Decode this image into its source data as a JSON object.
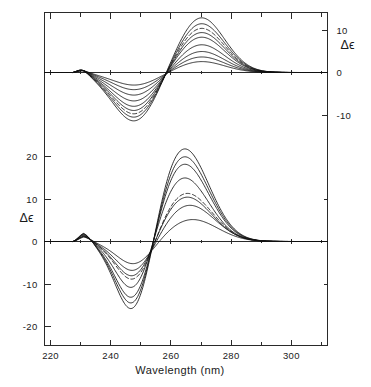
{
  "figure": {
    "background_color": "#ffffff",
    "line_color": "#111111"
  },
  "axes": {
    "x_title": "Wavelength  (nm)",
    "x_tick_labels": [
      "220",
      "240",
      "260",
      "280",
      "300"
    ],
    "x_major_ticks": [
      220,
      240,
      260,
      280,
      300
    ],
    "x_minor_ticks": [
      230,
      250,
      270,
      290,
      310
    ],
    "x_range": [
      218,
      312
    ],
    "left_axis_title": "Δϵ",
    "left_tick_labels": [
      "20",
      "10",
      "0",
      "-10",
      "-20"
    ],
    "left_tick_values": [
      20,
      10,
      0,
      -10,
      -20
    ],
    "right_axis_title": "Δϵ",
    "right_tick_labels": [
      "10",
      "0",
      "-10"
    ],
    "right_tick_values": [
      10,
      0,
      -10
    ]
  },
  "chart_data": {
    "type": "line",
    "title": "",
    "xlabel": "Wavelength  (nm)",
    "ylabel": "Δϵ",
    "xlim": [
      218,
      312
    ],
    "grid": false,
    "legend": "none",
    "panels": [
      {
        "name": "upper-panel",
        "ylim": [
          -16,
          16
        ],
        "y_ticks": [
          10,
          0,
          -10
        ],
        "y_axis_side": "right",
        "description": "Family of CD spectra with negative band near 248 nm and positive band near 270 nm",
        "crossover_nm": [
          233,
          259.5,
          292
        ],
        "series": [
          {
            "name": "curve-1",
            "style": "solid",
            "trough_nm": 248,
            "trough_value": -11.6,
            "peak_nm": 270,
            "peak_value": 13.0
          },
          {
            "name": "curve-2",
            "style": "solid",
            "trough_nm": 248,
            "trough_value": -10.7,
            "peak_nm": 270,
            "peak_value": 11.6
          },
          {
            "name": "curve-3",
            "style": "dashed",
            "trough_nm": 248,
            "trough_value": -9.9,
            "peak_nm": 270,
            "peak_value": 10.5
          },
          {
            "name": "curve-4",
            "style": "solid",
            "trough_nm": 248,
            "trough_value": -9.1,
            "peak_nm": 270,
            "peak_value": 9.5
          },
          {
            "name": "curve-5",
            "style": "solid",
            "trough_nm": 248,
            "trough_value": -8.1,
            "peak_nm": 270,
            "peak_value": 8.4
          },
          {
            "name": "curve-6",
            "style": "solid",
            "trough_nm": 248,
            "trough_value": -6.8,
            "peak_nm": 270,
            "peak_value": 6.6
          },
          {
            "name": "curve-7",
            "style": "solid",
            "trough_nm": 248,
            "trough_value": -5.4,
            "peak_nm": 270,
            "peak_value": 5.0
          },
          {
            "name": "curve-8",
            "style": "solid",
            "trough_nm": 248,
            "trough_value": -4.1,
            "peak_nm": 270,
            "peak_value": 3.7
          },
          {
            "name": "curve-9",
            "style": "solid",
            "trough_nm": 248,
            "trough_value": -3.0,
            "peak_nm": 270,
            "peak_value": 2.6
          }
        ]
      },
      {
        "name": "lower-panel",
        "ylim": [
          -24,
          26
        ],
        "y_ticks": [
          20,
          10,
          0,
          -10,
          -20
        ],
        "y_axis_side": "left",
        "description": "Family of CD spectra with deep negative band near 248 nm and strong positive band near 264 nm",
        "crossover_nm": [
          234.5,
          254.5,
          291
        ],
        "series": [
          {
            "name": "curve-1",
            "style": "solid",
            "trough_nm": 248,
            "trough_value": -19.0,
            "peak_nm": 264,
            "peak_value": 22.3
          },
          {
            "name": "curve-2",
            "style": "solid",
            "trough_nm": 248,
            "trough_value": -17.4,
            "peak_nm": 264,
            "peak_value": 20.4
          },
          {
            "name": "curve-3",
            "style": "solid",
            "trough_nm": 248,
            "trough_value": -15.8,
            "peak_nm": 264,
            "peak_value": 18.6
          },
          {
            "name": "curve-4",
            "style": "solid",
            "trough_nm": 248,
            "trough_value": -13.0,
            "peak_nm": 264,
            "peak_value": 15.3
          },
          {
            "name": "curve-5",
            "style": "dashed",
            "trough_nm": 248,
            "trough_value": -10.2,
            "peak_nm": 265,
            "peak_value": 11.5
          },
          {
            "name": "curve-6",
            "style": "solid",
            "trough_nm": 248,
            "trough_value": -9.3,
            "peak_nm": 265,
            "peak_value": 10.6
          },
          {
            "name": "curve-7",
            "style": "solid",
            "trough_nm": 248,
            "trough_value": -7.6,
            "peak_nm": 266,
            "peak_value": 8.6
          },
          {
            "name": "curve-8",
            "style": "solid",
            "trough_nm": 248,
            "trough_value": -5.6,
            "peak_nm": 267,
            "peak_value": 5.2
          }
        ]
      }
    ]
  }
}
